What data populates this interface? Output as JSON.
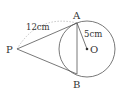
{
  "diagram": {
    "points": {
      "P": {
        "label": "P",
        "x": 17,
        "y": 49
      },
      "A": {
        "label": "A",
        "x": 77,
        "y": 23
      },
      "B": {
        "label": "B",
        "x": 77,
        "y": 74
      },
      "O": {
        "label": "O",
        "x": 87,
        "y": 49
      }
    },
    "circle": {
      "center": "O",
      "radius": 28
    },
    "labels": {
      "PA_length": "12cm",
      "radius_length": "5cm"
    },
    "segments": [
      "PA",
      "PB",
      "AB",
      "AO"
    ],
    "arc_annotation": "PA (dashed arc)",
    "colors": {
      "stroke": "#555555",
      "dashed": "#aaaaaa",
      "text": "#333333"
    }
  }
}
